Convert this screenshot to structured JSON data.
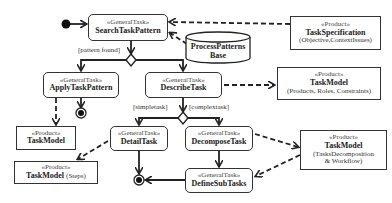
{
  "diagram": {
    "type": "UML activity diagram",
    "tasks": [
      {
        "id": "search",
        "stereotype": "«GeneralTask»",
        "name": "SearchTaskPattern"
      },
      {
        "id": "apply",
        "stereotype": "«GeneralTask»",
        "name": "ApplyTaskPattern"
      },
      {
        "id": "describe",
        "stereotype": "«GeneralTask»",
        "name": "DescribeTask"
      },
      {
        "id": "detail",
        "stereotype": "«GeneralTask»",
        "name": "DetailTask"
      },
      {
        "id": "decompose",
        "stereotype": "«GeneralTask»",
        "name": "DecomposeTask"
      },
      {
        "id": "define",
        "stereotype": "«GeneralTask»",
        "name": "DefineSubTasks"
      }
    ],
    "products": [
      {
        "id": "spec",
        "stereotype": "«Product»",
        "name": "TaskSpecification",
        "detail": "(Objective,ContextIssues)"
      },
      {
        "id": "model_prc",
        "stereotype": "«Product»",
        "name": "TaskModel",
        "detail": "(Products, Roles, Constraints)"
      },
      {
        "id": "model_apply",
        "stereotype": "«Product»",
        "name": "TaskModel",
        "detail": ""
      },
      {
        "id": "model_steps",
        "stereotype": "«Product»",
        "name": "TaskModel",
        "detail": "(Steps)"
      },
      {
        "id": "model_decomp",
        "stereotype": "«Product»",
        "name": "TaskModel",
        "detail_line1": "(TasksDecomposition",
        "detail_line2": "& Workflow)"
      }
    ],
    "datastore": {
      "line1": "ProcessPatterns",
      "line2": "Base"
    },
    "guards": {
      "pattern_found": "[pattern found]",
      "simpletask": "[simpletask]",
      "complextask": "[complextask]"
    }
  }
}
